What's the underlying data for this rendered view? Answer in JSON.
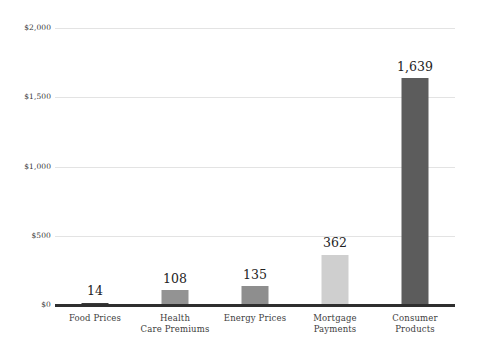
{
  "chart_data": {
    "type": "bar",
    "title": "",
    "subtitle": "",
    "xlabel": "",
    "ylabel": "",
    "categories": [
      "Food Prices",
      "Health\nCare Premiums",
      "Energy Prices",
      "Mortgage\nPayments",
      "Consumer\nProducts"
    ],
    "category_lines": [
      [
        "Food Prices"
      ],
      [
        "Health",
        "Care Premiums"
      ],
      [
        "Energy Prices"
      ],
      [
        "Mortgage",
        "Payments"
      ],
      [
        "Consumer",
        "Products"
      ]
    ],
    "values": [
      14,
      108,
      135,
      362,
      1639
    ],
    "data_labels": [
      "14",
      "108",
      "135",
      "362",
      "1,639"
    ],
    "bar_colors": [
      "#3a3a3a",
      "#939393",
      "#8e8e8e",
      "#cfcfcf",
      "#5c5c5c"
    ],
    "ylim": [
      0,
      2000
    ],
    "yticks": [
      0,
      500,
      1000,
      1500,
      2000
    ],
    "ytick_labels": [
      "$0",
      "$500",
      "$1,000",
      "$1,500",
      "$2,000"
    ],
    "grid": true,
    "grid_color": "#e3e3e3",
    "axis_color": "#2f2f2f",
    "legend": "none",
    "background": "#ffffff"
  },
  "axis": {
    "y_labels": [
      "$2,000",
      "$1,500",
      "$1,000",
      "$500",
      "$0"
    ]
  }
}
